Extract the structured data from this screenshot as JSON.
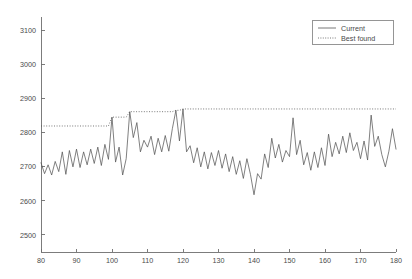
{
  "chart_data": {
    "type": "line",
    "title": "",
    "xlabel": "",
    "ylabel": "",
    "xlim": [
      80,
      180
    ],
    "ylim": [
      2450,
      3140
    ],
    "grid": false,
    "legend_position": "top-right",
    "xticks": [
      80,
      90,
      100,
      110,
      120,
      130,
      140,
      150,
      160,
      170,
      180
    ],
    "yticks": [
      2500,
      2600,
      2700,
      2800,
      2900,
      3000,
      3100
    ],
    "xtick_labels": [
      "80",
      "90",
      "100",
      "110",
      "120",
      "130",
      "140",
      "150",
      "160",
      "170",
      "180"
    ],
    "ytick_labels": [
      "2500",
      "2600",
      "2700",
      "2800",
      "2900",
      "3000",
      "3100"
    ],
    "x": [
      80,
      81,
      82,
      83,
      84,
      85,
      86,
      87,
      88,
      89,
      90,
      91,
      92,
      93,
      94,
      95,
      96,
      97,
      98,
      99,
      100,
      101,
      102,
      103,
      104,
      105,
      106,
      107,
      108,
      109,
      110,
      111,
      112,
      113,
      114,
      115,
      116,
      117,
      118,
      119,
      120,
      121,
      122,
      123,
      124,
      125,
      126,
      127,
      128,
      129,
      130,
      131,
      132,
      133,
      134,
      135,
      136,
      137,
      138,
      139,
      140,
      141,
      142,
      143,
      144,
      145,
      146,
      147,
      148,
      149,
      150,
      151,
      152,
      153,
      154,
      155,
      156,
      157,
      158,
      159,
      160,
      161,
      162,
      163,
      164,
      165,
      166,
      167,
      168,
      169,
      170,
      171,
      172,
      173,
      174,
      175,
      176,
      177,
      178,
      179,
      180
    ],
    "series": [
      {
        "name": "Current",
        "style": "solid",
        "color": "#555555",
        "values": [
          2712,
          2680,
          2706,
          2676,
          2716,
          2686,
          2744,
          2678,
          2748,
          2700,
          2752,
          2698,
          2744,
          2706,
          2752,
          2710,
          2758,
          2704,
          2766,
          2722,
          2846,
          2714,
          2758,
          2676,
          2724,
          2862,
          2786,
          2830,
          2744,
          2778,
          2758,
          2790,
          2736,
          2784,
          2744,
          2792,
          2746,
          2812,
          2866,
          2776,
          2870,
          2744,
          2762,
          2712,
          2756,
          2700,
          2744,
          2694,
          2742,
          2704,
          2748,
          2696,
          2738,
          2686,
          2730,
          2678,
          2718,
          2666,
          2724,
          2678,
          2618,
          2680,
          2664,
          2738,
          2698,
          2784,
          2726,
          2766,
          2714,
          2748,
          2730,
          2844,
          2736,
          2778,
          2706,
          2742,
          2690,
          2744,
          2698,
          2756,
          2704,
          2796,
          2730,
          2772,
          2738,
          2790,
          2742,
          2800,
          2748,
          2772,
          2724,
          2776,
          2720,
          2852,
          2760,
          2790,
          2736,
          2700,
          2746,
          2812,
          2752
        ]
      },
      {
        "name": "Best found",
        "style": "dotted",
        "color": "#555555",
        "values": [
          2820,
          2820,
          2820,
          2820,
          2820,
          2820,
          2820,
          2820,
          2820,
          2820,
          2820,
          2820,
          2820,
          2820,
          2820,
          2820,
          2820,
          2820,
          2820,
          2820,
          2846,
          2846,
          2846,
          2846,
          2846,
          2862,
          2862,
          2862,
          2862,
          2862,
          2862,
          2862,
          2862,
          2862,
          2862,
          2862,
          2862,
          2862,
          2866,
          2866,
          2870,
          2870,
          2870,
          2870,
          2870,
          2870,
          2870,
          2870,
          2870,
          2870,
          2870,
          2870,
          2870,
          2870,
          2870,
          2870,
          2870,
          2870,
          2870,
          2870,
          2870,
          2870,
          2870,
          2870,
          2870,
          2870,
          2870,
          2870,
          2870,
          2870,
          2870,
          2870,
          2870,
          2870,
          2870,
          2870,
          2870,
          2870,
          2870,
          2870,
          2870,
          2870,
          2870,
          2870,
          2870,
          2870,
          2870,
          2870,
          2870,
          2870,
          2870,
          2870,
          2870,
          2870,
          2870,
          2870,
          2870,
          2870,
          2870,
          2870,
          2870
        ]
      }
    ]
  },
  "legend": {
    "entries": [
      {
        "label": "Current"
      },
      {
        "label": "Best found"
      }
    ]
  },
  "colors": {
    "line": "#555555",
    "axis": "#6e6e6e",
    "text": "#4a4a4a",
    "background": "#ffffff"
  }
}
